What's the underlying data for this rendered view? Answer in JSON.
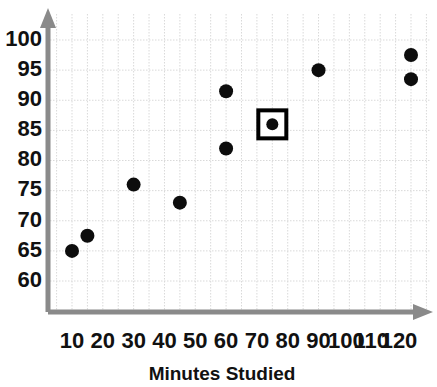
{
  "chart_data": {
    "type": "scatter",
    "title": "",
    "xlabel": "Minutes Studied",
    "ylabel": "",
    "xlim": [
      0,
      127
    ],
    "ylim": [
      56,
      102
    ],
    "grid": true,
    "legend": "none",
    "x_ticks": [
      10,
      20,
      30,
      40,
      50,
      60,
      70,
      80,
      90,
      100,
      110,
      120
    ],
    "x_tick_labels": [
      "10",
      "20",
      "30",
      "40",
      "50",
      "60",
      "70",
      "80",
      "90",
      "100",
      "110",
      "120"
    ],
    "y_ticks": [
      60,
      65,
      70,
      75,
      80,
      85,
      90,
      95,
      100
    ],
    "y_tick_labels": [
      "60",
      "65",
      "70",
      "75",
      "80",
      "85",
      "90",
      "95",
      "100"
    ],
    "marker_color": "#0d0d0d",
    "grid_color": "#d9d9d9",
    "axis_color": "#8a8a8a",
    "highlight_color": "#000000",
    "points": [
      {
        "x": 10,
        "y": 65,
        "highlighted": false
      },
      {
        "x": 15,
        "y": 67.5,
        "highlighted": false
      },
      {
        "x": 30,
        "y": 76,
        "highlighted": false
      },
      {
        "x": 45,
        "y": 73,
        "highlighted": false
      },
      {
        "x": 60,
        "y": 91.5,
        "highlighted": false
      },
      {
        "x": 60,
        "y": 82,
        "highlighted": false
      },
      {
        "x": 75,
        "y": 86,
        "highlighted": true
      },
      {
        "x": 90,
        "y": 95,
        "highlighted": false
      },
      {
        "x": 120,
        "y": 97.5,
        "highlighted": false
      },
      {
        "x": 120,
        "y": 93.5,
        "highlighted": false
      }
    ]
  },
  "axis_titles": {
    "x": "Minutes Studied"
  }
}
